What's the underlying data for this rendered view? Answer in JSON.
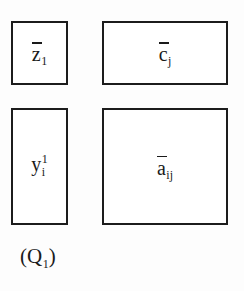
{
  "figure": {
    "caption": {
      "open_paren": "(",
      "symbol": "Q",
      "subscript": "1",
      "close_paren": ")",
      "full_text": "(Q1)"
    },
    "blocks": [
      {
        "id": "z",
        "symbol": "z",
        "subscript": "1",
        "superscript": "",
        "overbar": true,
        "label": "z-bar-1"
      },
      {
        "id": "c",
        "symbol": "c",
        "subscript": "j",
        "superscript": "",
        "overbar": true,
        "label": "c-bar-j"
      },
      {
        "id": "y",
        "symbol": "y",
        "subscript": "i",
        "superscript": "1",
        "overbar": false,
        "label": "y-i-superscript-1"
      },
      {
        "id": "a",
        "symbol": "a",
        "subscript": "ij",
        "superscript": "",
        "overbar": true,
        "label": "a-bar-ij"
      }
    ],
    "colors": {
      "border": "#1c1c1c",
      "text": "#1a1a1a",
      "cell_background": "#ffffff",
      "page_background": "#fdfdfd"
    }
  }
}
